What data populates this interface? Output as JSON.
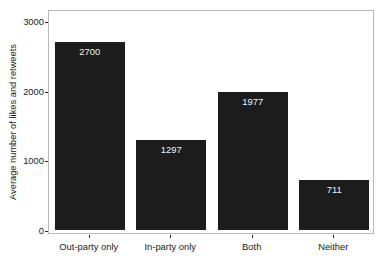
{
  "chart_data": {
    "type": "bar",
    "title": "",
    "xlabel": "",
    "ylabel": "Average number of likes and retweets",
    "categories": [
      "Out-party only",
      "In-party only",
      "Both",
      "Neither"
    ],
    "values": [
      2700,
      1297,
      1977,
      711
    ],
    "value_labels": [
      "2700",
      "1297",
      "1977",
      "711"
    ],
    "ylim": [
      0,
      3000
    ],
    "yticks": [
      0,
      1000,
      2000,
      3000
    ],
    "ytick_labels": [
      "0",
      "1000",
      "2000",
      "3000"
    ],
    "grid": false,
    "legend": null,
    "bar_color": "#1c1c1c",
    "value_label_color": "#f2f2f2",
    "axis_color": "#b9b9b9",
    "background": "#ffffff"
  }
}
